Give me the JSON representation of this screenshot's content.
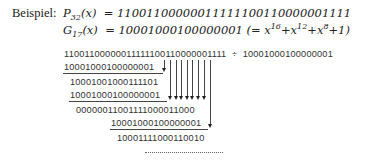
{
  "example": {
    "label": "Beispiel:",
    "p_name": "P",
    "p_sub": "32",
    "p_arg": "(x)",
    "p_value": "= 11001100000011111100110000001111",
    "g_name": "G",
    "g_sub": "17",
    "g_arg": "(x)",
    "g_value": "= 10001000100000001 (= x",
    "g_exp1": "16",
    "g_plus1": "+x",
    "g_exp2": "12",
    "g_plus2": "+x",
    "g_exp3": "8",
    "g_tail": "+1)"
  },
  "division": {
    "dividend": "11001100000011111100110000001111",
    "operator": "÷",
    "divisor": "10001000100000001",
    "steps": [
      "10001000100000001",
      "10001001000111101",
      "10001000100000001",
      "00000011001111000011000",
      "10001000100000001",
      "10001111000110010"
    ],
    "continuation": "..................."
  }
}
